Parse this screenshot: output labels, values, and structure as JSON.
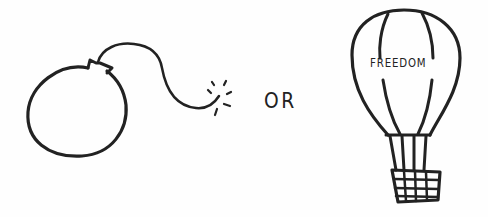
{
  "illustration": {
    "left": {
      "subject": "bomb",
      "icon": "bomb-icon",
      "fuse_spark": "spark-icon"
    },
    "connector_text": "OR",
    "right": {
      "subject": "hot-air-balloon",
      "icon": "hot-air-balloon-icon",
      "balloon_text": "FREEDOM"
    },
    "colors": {
      "ink": "#222222",
      "background": "#fefefe"
    }
  }
}
